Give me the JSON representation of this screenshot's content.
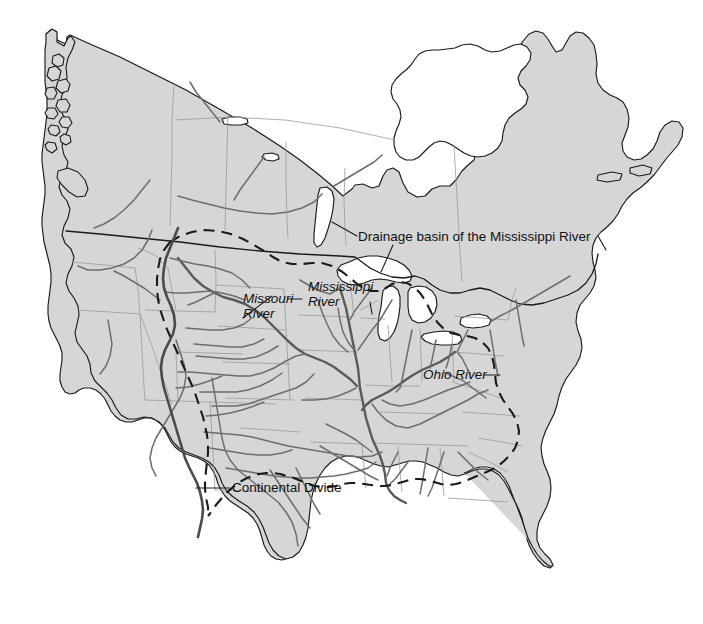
{
  "figure": {
    "title": "Drainage basin of the Mississippi River",
    "kind": "thematic-map",
    "region": "North America (United States and Canada)",
    "background_color": "#ffffff",
    "land_color": "#d6d6d6",
    "coastline_color": "#1a1a1a",
    "subdivision_color": "#9a9a9a",
    "river_color": "#6d6d6d",
    "basin_boundary_color": "#1a1a1a",
    "continental_divide_color": "#4a4a4a"
  },
  "labels": {
    "basin": {
      "text": "Drainage basin of the Mississippi River",
      "style": "regular",
      "x": 358,
      "y": 241
    },
    "missouri": {
      "line1": "Missouri",
      "line2": "River",
      "style": "italic",
      "x": 243,
      "y": 303
    },
    "mississippi": {
      "line1": "Mississippi",
      "line2": "River",
      "style": "italic",
      "x": 308,
      "y": 291
    },
    "ohio": {
      "text": "Ohio River",
      "style": "italic",
      "x": 423,
      "y": 379
    },
    "divide": {
      "text": "Continental Divide",
      "style": "regular",
      "x": 232,
      "y": 492
    }
  },
  "legend_features": [
    {
      "name": "Drainage basin of the Mississippi River",
      "symbol": "dashed-line"
    },
    {
      "name": "Continental Divide",
      "symbol": "solid-thick-line"
    },
    {
      "name": "Missouri River",
      "symbol": "river-line"
    },
    {
      "name": "Mississippi River",
      "symbol": "river-line"
    },
    {
      "name": "Ohio River",
      "symbol": "river-line"
    }
  ]
}
